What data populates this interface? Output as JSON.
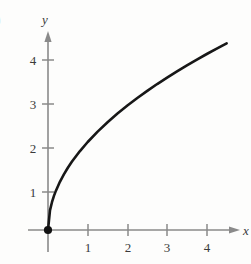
{
  "figure": {
    "part_label": ")",
    "background_color": "#fdfdfc",
    "axis_color": "#8a8a8a",
    "curve_color": "#171717",
    "label_color": "#3a3a3a"
  },
  "chart_data": {
    "type": "line",
    "title": "",
    "subtitle": "",
    "xlabel": "x",
    "ylabel": "y",
    "equation": "y = 2*sqrt(x)",
    "grid": false,
    "legend": null,
    "xlim": [
      -0.25,
      4.6
    ],
    "ylim": [
      -0.35,
      4.6
    ],
    "xticks": [
      1,
      2,
      3,
      4
    ],
    "yticks": [
      1,
      2,
      3,
      4
    ],
    "xtick_labels": [
      "1",
      "2",
      "3",
      "4"
    ],
    "ytick_labels": [
      "1",
      "2",
      "3",
      "4"
    ],
    "axis_arrows": [
      "x-positive",
      "y-positive"
    ],
    "markers": [
      {
        "name": "origin-point",
        "x": 0,
        "y": 0,
        "style": "filled-circle"
      }
    ],
    "series": [
      {
        "name": "y = 2√x",
        "x": [
          0,
          0.05,
          0.1,
          0.15,
          0.2,
          0.3,
          0.4,
          0.5,
          0.6,
          0.8,
          1.0,
          1.25,
          1.5,
          1.75,
          2.0,
          2.25,
          2.5,
          2.75,
          3.0,
          3.25,
          3.5,
          3.75,
          4.0,
          4.25,
          4.5
        ],
        "y": [
          0,
          0.447,
          0.632,
          0.775,
          0.894,
          1.095,
          1.265,
          1.414,
          1.549,
          1.789,
          2.0,
          2.236,
          2.449,
          2.646,
          2.828,
          3.0,
          3.162,
          3.317,
          3.464,
          3.606,
          3.742,
          3.873,
          4.0,
          4.123,
          4.243
        ]
      }
    ]
  },
  "tick_text": {
    "y1": "1",
    "y2": "2",
    "y3": "3",
    "y4": "4",
    "x1": "1",
    "x2": "2",
    "x3": "3",
    "x4": "4"
  },
  "axis_names": {
    "y": "y",
    "x": "x"
  }
}
